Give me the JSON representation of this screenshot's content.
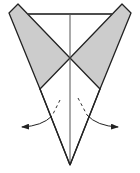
{
  "diagram": {
    "title": "",
    "type": "origami-fold-step",
    "colors": {
      "background": "#ffffff",
      "paper_back": "#cccccc",
      "paper_front": "#ffffff",
      "line": "#222222",
      "center_line": "#444444",
      "arrow": "#222222"
    },
    "elements": {
      "outline": "kite-shaped paper model with two shaded flaps",
      "left_flap": "shaded triangular flap (top-left)",
      "right_flap": "shaded triangular flap (top-right)",
      "center_crease": "vertical center line",
      "top_edge": "horizontal top edge",
      "left_arrow": "curved fold arrow pointing left with dashed valley line",
      "right_arrow": "curved fold arrow pointing right with dashed valley line"
    }
  }
}
